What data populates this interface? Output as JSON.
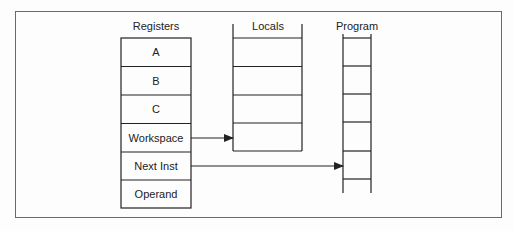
{
  "caption_fragment": "Stack organization of the pro...",
  "diagram": {
    "registers": {
      "title": "Registers",
      "cells": [
        "A",
        "B",
        "C",
        "Workspace",
        "Next Inst",
        "Operand"
      ]
    },
    "locals": {
      "title": "Locals",
      "rows": 4
    },
    "program": {
      "title": "Program",
      "rungs": 6
    },
    "arrows": [
      {
        "from": "Workspace",
        "to": "Locals"
      },
      {
        "from": "Next Inst",
        "to": "Program"
      }
    ],
    "colors": {
      "line": "#222222",
      "frame": "#6a6a6a",
      "background": "#fdfdfd"
    }
  }
}
